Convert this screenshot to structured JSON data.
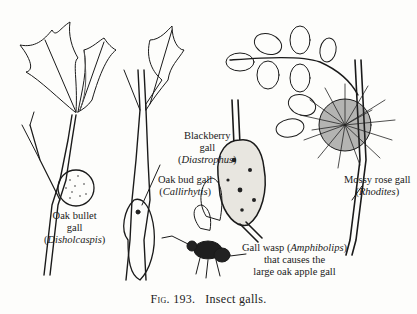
{
  "figure": {
    "number_prefix": "Fig.",
    "number": "193.",
    "title": "Insect galls."
  },
  "labels": [
    {
      "id": "oak-bullet",
      "line1": "Oak bullet",
      "line2": "gall",
      "latin": "Disholcaspis"
    },
    {
      "id": "oak-bud",
      "line1": "Oak bud gall",
      "latin": "Callirhytis"
    },
    {
      "id": "blackberry",
      "line1": "Blackberry",
      "line2": "gall",
      "latin": "Diastrophus"
    },
    {
      "id": "mossy-rose",
      "line1": "Mossy rose gall",
      "latin": "Rhodites"
    },
    {
      "id": "gall-wasp",
      "line1": "Gall wasp",
      "latin": "Amphibolips",
      "line2": "that causes the",
      "line3": "large oak apple gall"
    }
  ],
  "illustrations": [
    "oak-leaf-twig-with-bullet-gall",
    "oak-twig-with-bud-gall",
    "blackberry-stem-gall",
    "rose-leaves-with-mossy-gall",
    "gall-wasp-insect"
  ],
  "colors": {
    "ink": "#1a1a1a",
    "paper": "#fdfdfb"
  }
}
